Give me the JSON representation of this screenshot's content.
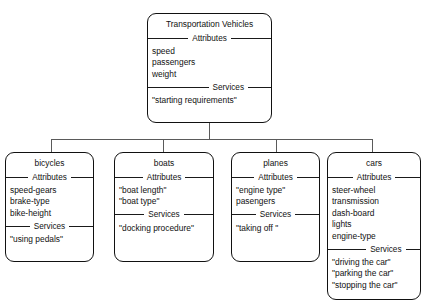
{
  "diagram": {
    "type": "class-hierarchy",
    "attributes_caption": "Attributes",
    "services_caption": "Services",
    "root": {
      "title": "Transportation Vehicles",
      "attributes": [
        "speed",
        "passengers",
        "weight"
      ],
      "services": [
        "\"starting requirements\""
      ]
    },
    "children": [
      {
        "title": "bicycles",
        "attributes": [
          "speed-gears",
          "brake-type",
          "bike-height"
        ],
        "services": [
          "\"using pedals\""
        ]
      },
      {
        "title": "boats",
        "attributes": [
          "\"boat length\"",
          "\"boat type\""
        ],
        "services": [
          "\"docking procedure\""
        ]
      },
      {
        "title": "planes",
        "attributes": [
          "\"engine type\"",
          "pasengers"
        ],
        "services": [
          "\"taking off  \""
        ]
      },
      {
        "title": "cars",
        "attributes": [
          "steer-wheel",
          "transmission",
          "dash-board",
          "lights",
          "engine-type"
        ],
        "services": [
          "\"driving the car\"",
          "\"parking the car\"",
          "\"stopping the car\""
        ]
      }
    ]
  },
  "colors": {
    "box_border": "#111111",
    "connector": "#5a5a5a",
    "background": "#ffffff",
    "text": "#111111"
  }
}
